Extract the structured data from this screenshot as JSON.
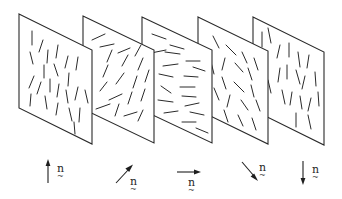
{
  "figure": {
    "stroke_color": "#2a2a2a",
    "background": "#ffffff"
  },
  "panels": [
    {
      "id": 1,
      "x": 19,
      "orientation": "vertical"
    },
    {
      "id": 2,
      "x": 82,
      "orientation": "tilted-right"
    },
    {
      "id": 3,
      "x": 140,
      "orientation": "horizontal"
    },
    {
      "id": 4,
      "x": 197,
      "orientation": "tilted-left"
    },
    {
      "id": 5,
      "x": 253,
      "orientation": "vertical"
    }
  ],
  "directors": [
    {
      "id": 1,
      "direction": "up",
      "label": "n",
      "label_accent": "~"
    },
    {
      "id": 2,
      "direction": "up-right",
      "label": "n",
      "label_accent": "~"
    },
    {
      "id": 3,
      "direction": "right",
      "label": "n",
      "label_accent": "~"
    },
    {
      "id": 4,
      "direction": "down-right",
      "label": "n",
      "label_accent": "~"
    },
    {
      "id": 5,
      "direction": "down",
      "label": "n",
      "label_accent": "~"
    }
  ]
}
